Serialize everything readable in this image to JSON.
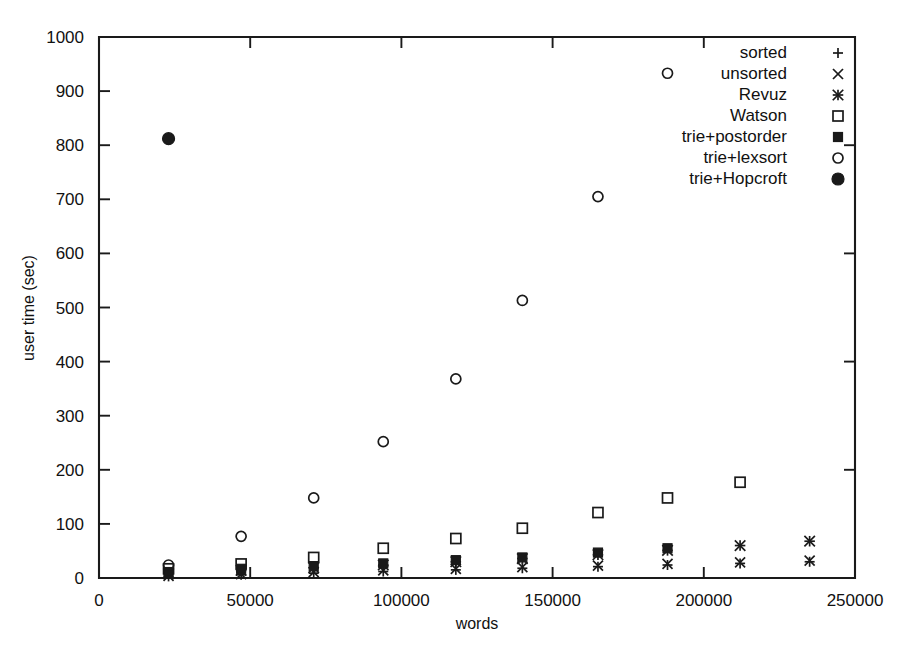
{
  "chart_data": {
    "type": "scatter",
    "title": "",
    "xlabel": "words",
    "ylabel": "user time (sec)",
    "xlim": [
      0,
      250000
    ],
    "ylim": [
      0,
      1000
    ],
    "xticks": [
      0,
      50000,
      100000,
      150000,
      200000,
      250000
    ],
    "xticklabels": [
      "0",
      "50000",
      "100000",
      "150000",
      "200000",
      "250000"
    ],
    "yticks": [
      0,
      100,
      200,
      300,
      400,
      500,
      600,
      700,
      800,
      900,
      1000
    ],
    "yticklabels": [
      "0",
      "100",
      "200",
      "300",
      "400",
      "500",
      "600",
      "700",
      "800",
      "900",
      "1000"
    ],
    "grid": false,
    "legend_position": "top-right",
    "series": [
      {
        "name": "sorted",
        "marker": "plus",
        "x": [
          23000,
          47000,
          71000,
          94000,
          118000,
          140000,
          165000,
          188000,
          212000,
          235000
        ],
        "y": [
          3,
          6,
          9,
          12,
          15,
          18,
          21,
          24,
          27,
          30
        ]
      },
      {
        "name": "unsorted",
        "marker": "cross",
        "x": [
          23000,
          47000,
          71000,
          94000,
          118000,
          140000,
          165000,
          188000,
          212000,
          235000
        ],
        "y": [
          4,
          7,
          11,
          14,
          17,
          20,
          23,
          26,
          29,
          32
        ]
      },
      {
        "name": "Revuz",
        "marker": "asterisk",
        "x": [
          23000,
          47000,
          71000,
          94000,
          118000,
          140000,
          165000,
          188000,
          212000,
          235000
        ],
        "y": [
          8,
          14,
          19,
          24,
          30,
          36,
          43,
          51,
          60,
          68
        ]
      },
      {
        "name": "Watson",
        "marker": "open-square",
        "x": [
          23000,
          47000,
          71000,
          94000,
          118000,
          140000,
          165000,
          188000,
          212000
        ],
        "y": [
          17,
          26,
          38,
          55,
          73,
          92,
          121,
          148,
          177
        ]
      },
      {
        "name": "trie+postorder",
        "marker": "filled-square",
        "x": [
          23000,
          47000,
          71000,
          94000,
          118000,
          140000,
          165000,
          188000
        ],
        "y": [
          11,
          17,
          22,
          27,
          33,
          38,
          47,
          55
        ]
      },
      {
        "name": "trie+lexsort",
        "marker": "open-circle",
        "x": [
          23000,
          47000,
          71000,
          94000,
          118000,
          140000,
          165000,
          188000
        ],
        "y": [
          24,
          77,
          148,
          252,
          368,
          513,
          705,
          933
        ]
      },
      {
        "name": "trie+Hopcroft",
        "marker": "filled-circle",
        "x": [
          23000
        ],
        "y": [
          812
        ]
      }
    ]
  },
  "legend": {
    "entries": [
      {
        "label": "sorted",
        "marker": "plus"
      },
      {
        "label": "unsorted",
        "marker": "cross"
      },
      {
        "label": "Revuz",
        "marker": "asterisk"
      },
      {
        "label": "Watson",
        "marker": "open-square"
      },
      {
        "label": "trie+postorder",
        "marker": "filled-square"
      },
      {
        "label": "trie+lexsort",
        "marker": "open-circle"
      },
      {
        "label": "trie+Hopcroft",
        "marker": "filled-circle"
      }
    ]
  },
  "axes": {
    "x_title": "words",
    "y_title": "user time (sec)"
  }
}
